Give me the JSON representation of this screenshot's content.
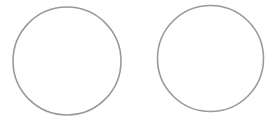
{
  "canvas": {
    "width": 274,
    "height": 121,
    "background": "#ffffff"
  },
  "shapes": [
    {
      "type": "circle",
      "name": "left-circle",
      "cx": 67,
      "cy": 61,
      "r": 54,
      "stroke": "#9a9a9a",
      "stroke_width": 1.6,
      "fill": "none"
    },
    {
      "type": "circle",
      "name": "right-circle",
      "cx": 210.5,
      "cy": 58.5,
      "r": 53,
      "stroke": "#9a9a9a",
      "stroke_width": 1.6,
      "fill": "none"
    }
  ]
}
